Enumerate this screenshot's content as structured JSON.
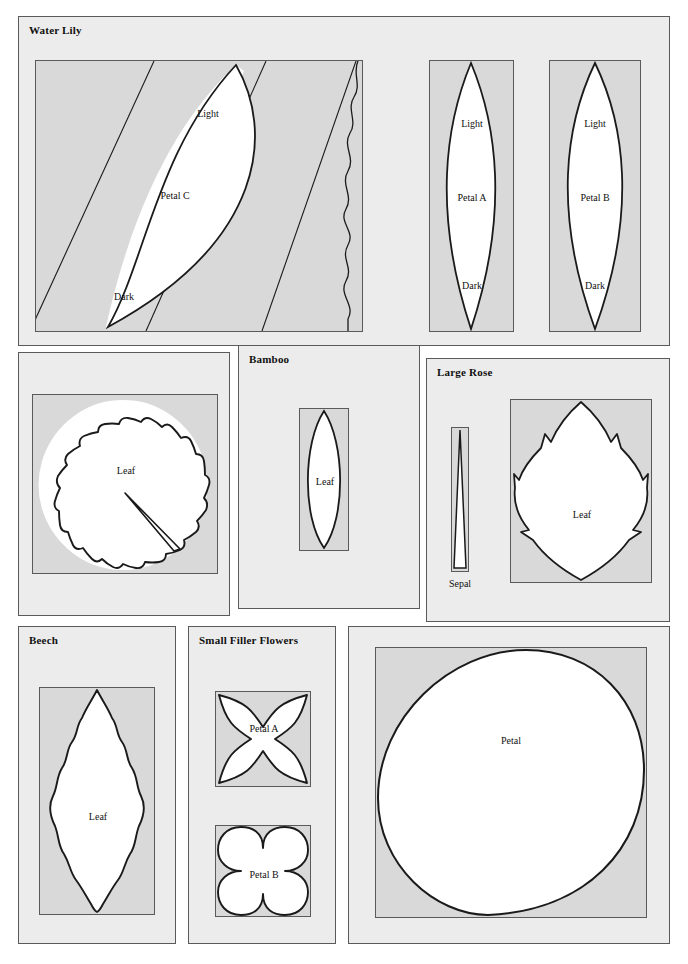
{
  "document": {
    "kind": "sewing-pattern-template-sheet",
    "background_color": "#ffffff",
    "panel_fill": "#ececec",
    "tile_fill": "#d9d9d9",
    "line_color": "#1a1a1a",
    "border_color": "#5a5a5a"
  },
  "groups": {
    "water_lily": {
      "title": "Water Lily",
      "petal_c": {
        "shape_label": "Petal C",
        "top_label": "Light",
        "bottom_label": "Dark"
      },
      "petal_a": {
        "shape_label": "Petal A",
        "top_label": "Light",
        "bottom_label": "Dark"
      },
      "petal_b": {
        "shape_label": "Petal B",
        "top_label": "Light",
        "bottom_label": "Dark"
      }
    },
    "water_lily_leaf": {
      "title": "",
      "leaf": {
        "shape_label": "Leaf"
      }
    },
    "bamboo": {
      "title": "Bamboo",
      "leaf": {
        "shape_label": "Leaf"
      }
    },
    "large_rose": {
      "title": "Large Rose",
      "sepal": {
        "shape_label": "Sepal"
      },
      "leaf": {
        "shape_label": "Leaf"
      }
    },
    "beech": {
      "title": "Beech",
      "leaf": {
        "shape_label": "Leaf"
      }
    },
    "small_filler_flowers": {
      "title": "Small Filler Flowers",
      "petal_a": {
        "shape_label": "Petal A"
      },
      "petal_b": {
        "shape_label": "Petal B"
      }
    },
    "large_petal": {
      "title": "",
      "petal": {
        "shape_label": "Petal"
      }
    }
  }
}
